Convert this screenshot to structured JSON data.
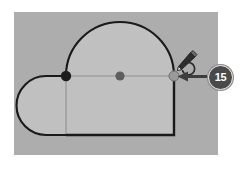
{
  "app": {
    "view_name": "vector-shape-editor-canvas",
    "canvas_background_color": "#adadad",
    "page_background_color": "#ffffff"
  },
  "shape": {
    "name": "compound-path-shape",
    "fill_color": "#c0c0c0",
    "stroke_color": "#1a1a1a",
    "description": "rectangle with semicircular dome on top and rounded half-capsule bulge on the left",
    "guide_line_color": "#8f8f8f"
  },
  "nodes": [
    {
      "id": "node-left",
      "label": "left anchor point",
      "state": "anchor",
      "color": "#1c1c1c"
    },
    {
      "id": "node-middle",
      "label": "middle anchor point",
      "state": "anchor",
      "color": "#5e5e5e"
    },
    {
      "id": "node-right",
      "label": "right anchor point",
      "state": "selected",
      "color": "#9a9a9a"
    }
  ],
  "cursor": {
    "name": "pen-tool-cursor",
    "label": "pen tool with rotate handle",
    "color": "#2b2b2b"
  },
  "annotation": {
    "badge_number": "15",
    "badge_color": "#4a4a4a",
    "badge_text_color": "#ffffff",
    "arrow_color": "#3d3d3d",
    "arrow_direction": "left",
    "points_to": "node-right"
  }
}
